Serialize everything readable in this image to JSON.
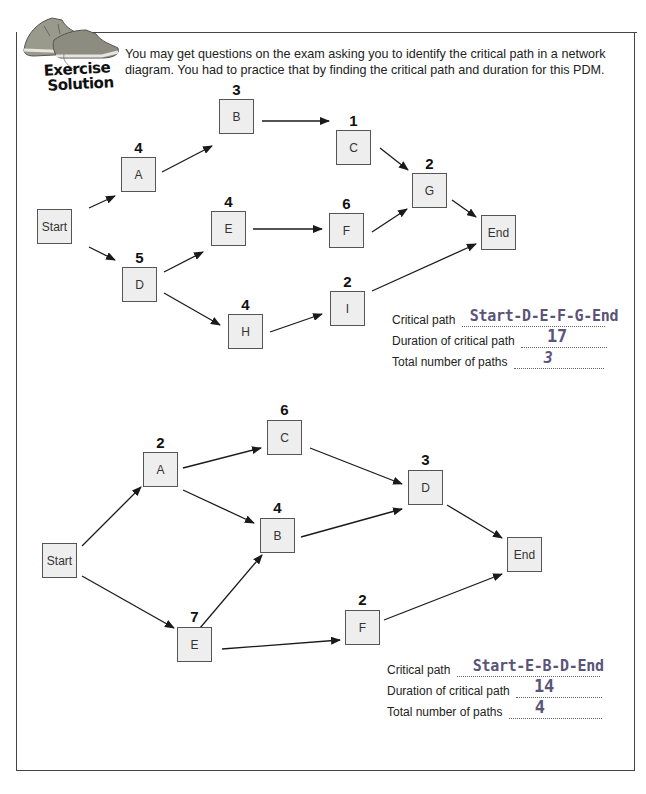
{
  "header": {
    "logo_line1": "Exercise",
    "logo_line2": "Solution",
    "intro": "You may get questions on the exam asking you to identify the critical path in a network diagram. You had to practice that by finding the critical path and duration for this PDM."
  },
  "diagram1": {
    "nodes": {
      "start": {
        "label": "Start"
      },
      "a": {
        "label": "A",
        "duration": "4"
      },
      "b": {
        "label": "B",
        "duration": "3"
      },
      "c": {
        "label": "C",
        "duration": "1"
      },
      "g": {
        "label": "G",
        "duration": "2"
      },
      "d": {
        "label": "D",
        "duration": "5"
      },
      "e": {
        "label": "E",
        "duration": "4"
      },
      "f": {
        "label": "F",
        "duration": "6"
      },
      "h": {
        "label": "H",
        "duration": "4"
      },
      "i": {
        "label": "I",
        "duration": "2"
      },
      "end": {
        "label": "End"
      }
    },
    "edges": [
      [
        "Start",
        "A"
      ],
      [
        "A",
        "B"
      ],
      [
        "B",
        "C"
      ],
      [
        "C",
        "G"
      ],
      [
        "Start",
        "D"
      ],
      [
        "D",
        "E"
      ],
      [
        "E",
        "F"
      ],
      [
        "F",
        "G"
      ],
      [
        "G",
        "End"
      ],
      [
        "D",
        "H"
      ],
      [
        "H",
        "I"
      ],
      [
        "I",
        "End"
      ]
    ],
    "answers": {
      "critical_path_label": "Critical path",
      "critical_path_value": "Start-D-E-F-G-End",
      "duration_label": "Duration of critical path",
      "duration_value": "17",
      "paths_label": "Total number of paths",
      "paths_value": "3"
    }
  },
  "diagram2": {
    "nodes": {
      "start": {
        "label": "Start"
      },
      "a": {
        "label": "A",
        "duration": "2"
      },
      "c": {
        "label": "C",
        "duration": "6"
      },
      "b": {
        "label": "B",
        "duration": "4"
      },
      "d": {
        "label": "D",
        "duration": "3"
      },
      "e": {
        "label": "E",
        "duration": "7"
      },
      "f": {
        "label": "F",
        "duration": "2"
      },
      "end": {
        "label": "End"
      }
    },
    "edges": [
      [
        "Start",
        "A"
      ],
      [
        "A",
        "C"
      ],
      [
        "A",
        "B"
      ],
      [
        "C",
        "D"
      ],
      [
        "B",
        "D"
      ],
      [
        "D",
        "End"
      ],
      [
        "Start",
        "E"
      ],
      [
        "E",
        "B"
      ],
      [
        "E",
        "F"
      ],
      [
        "F",
        "End"
      ]
    ],
    "answers": {
      "critical_path_label": "Critical path",
      "critical_path_value": "Start-E-B-D-End",
      "duration_label": "Duration of critical path",
      "duration_value": "14",
      "paths_label": "Total number of paths",
      "paths_value": "4"
    }
  },
  "colors": {
    "node_fill": "#eeeeee",
    "node_border": "#555555",
    "answer_ink": "#5a5478"
  }
}
